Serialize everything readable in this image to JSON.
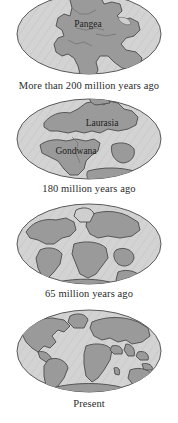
{
  "figure": {
    "title_visible": false,
    "background_color": "#ffffff",
    "ocean_color": "#d2d2d2",
    "land_color": "#9a9a9a",
    "outline_color": "#4a4a4a",
    "caption_color": "#2b2b2b",
    "panel_count": 4
  },
  "panels": [
    {
      "id": "pangea",
      "caption": "More than 200 million years ago",
      "labels": [
        {
          "text": "Pangea",
          "x": 88,
          "y": 24,
          "font_size": 9.5
        }
      ]
    },
    {
      "id": "laurasia-gondwana",
      "caption": "180 million years ago",
      "labels": [
        {
          "text": "Laurasia",
          "x": 100,
          "y": 126,
          "font_size": 9.5
        },
        {
          "text": "Gondwana",
          "x": 78,
          "y": 154,
          "font_size": 9.5
        }
      ]
    },
    {
      "id": "cretaceous",
      "caption": "65 million years ago",
      "labels": []
    },
    {
      "id": "present",
      "caption": "Present",
      "labels": []
    }
  ]
}
